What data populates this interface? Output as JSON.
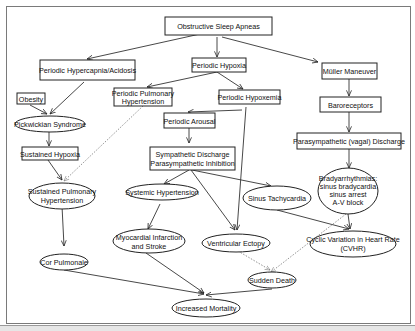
{
  "diagram": {
    "title": "Obstructive Sleep Apneas",
    "nodes": {
      "osa": "Obstructive Sleep Apneas",
      "hypercapnia": "Periodic Hypercapnia/Acidosis",
      "hypoxia": "Periodic Hypoxia",
      "muller": "Müller Maneuver",
      "obesity": "Obesity",
      "ppulm_l1": "Periodic Pulmonary",
      "ppulm_l2": "Hypertension",
      "hypoxemia": "Periodic Hypoxemia",
      "baroreceptors": "Baroreceptors",
      "pickwickian": "Pickwickian Syndrome",
      "arousal": "Periodic Arousal",
      "vagal": "Parasympathetic (vagal) Discharge",
      "sustained_hypoxia": "Sustained Hypoxia",
      "symp_l1": "Sympathetic Discharge",
      "symp_l2": "Parasympathetic Inhibition",
      "brady_l1": "Bradyarrhythmias:",
      "brady_l2": "sinus bradycardia",
      "brady_l3": "sinus arrest",
      "brady_l4": "A-V block",
      "spulm_l1": "Sustained Pulmonary",
      "spulm_l2": "Hypertension",
      "systemic_htn": "Systemic Hypertension",
      "sinus_tachy": "Sinus Tachycardia",
      "mi_l1": "Myocardial Infarction",
      "mi_l2": "and Stroke",
      "vent_ectopy": "Ventricular Ectopy",
      "cvhr_l1": "Cyclic Variation in Heart Rate",
      "cvhr_l2": "(CVHR)",
      "cor_pulmonale": "Cor Pulmonale",
      "sudden_death": "Sudden Death",
      "increased_mortality": "Increased Mortality"
    },
    "edges": [
      {
        "from": "Obstructive Sleep Apneas",
        "to": "Periodic Hypercapnia/Acidosis",
        "style": "solid"
      },
      {
        "from": "Obstructive Sleep Apneas",
        "to": "Periodic Hypoxia",
        "style": "solid"
      },
      {
        "from": "Obstructive Sleep Apneas",
        "to": "Müller Maneuver",
        "style": "solid"
      },
      {
        "from": "Periodic Hypoxia",
        "to": "Periodic Pulmonary Hypertension",
        "style": "solid"
      },
      {
        "from": "Periodic Hypoxia",
        "to": "Periodic Hypoxemia",
        "style": "solid"
      },
      {
        "from": "Periodic Hypercapnia/Acidosis",
        "to": "Pickwickian Syndrome",
        "style": "solid"
      },
      {
        "from": "Obesity",
        "to": "Pickwickian Syndrome",
        "style": "solid"
      },
      {
        "from": "Müller Maneuver",
        "to": "Baroreceptors",
        "style": "solid"
      },
      {
        "from": "Baroreceptors",
        "to": "Parasympathetic (vagal) Discharge",
        "style": "solid"
      },
      {
        "from": "Parasympathetic (vagal) Discharge",
        "to": "Bradyarrhythmias",
        "style": "solid"
      },
      {
        "from": "Periodic Hypoxemia",
        "to": "Periodic Arousal",
        "style": "solid"
      },
      {
        "from": "Periodic Hypoxemia",
        "to": "Ventricular Ectopy",
        "style": "solid"
      },
      {
        "from": "Periodic Arousal",
        "to": "Sympathetic Discharge Parasympathetic Inhibition",
        "style": "solid"
      },
      {
        "from": "Pickwickian Syndrome",
        "to": "Sustained Hypoxia",
        "style": "solid"
      },
      {
        "from": "Sustained Hypoxia",
        "to": "Sustained Pulmonary Hypertension",
        "style": "solid"
      },
      {
        "from": "Periodic Pulmonary Hypertension",
        "to": "Sustained Pulmonary Hypertension",
        "style": "dotted"
      },
      {
        "from": "Sympathetic Discharge Parasympathetic Inhibition",
        "to": "Systemic Hypertension",
        "style": "solid"
      },
      {
        "from": "Sympathetic Discharge Parasympathetic Inhibition",
        "to": "Sinus Tachycardia",
        "style": "solid"
      },
      {
        "from": "Sympathetic Discharge Parasympathetic Inhibition",
        "to": "Ventricular Ectopy",
        "style": "solid"
      },
      {
        "from": "Systemic Hypertension",
        "to": "Myocardial Infarction and Stroke",
        "style": "solid"
      },
      {
        "from": "Sinus Tachycardia",
        "to": "Cyclic Variation in Heart Rate (CVHR)",
        "style": "solid"
      },
      {
        "from": "Bradyarrhythmias",
        "to": "Cyclic Variation in Heart Rate (CVHR)",
        "style": "solid"
      },
      {
        "from": "Bradyarrhythmias",
        "to": "Sudden Death",
        "style": "dotted"
      },
      {
        "from": "Ventricular Ectopy",
        "to": "Sudden Death",
        "style": "dotted"
      },
      {
        "from": "Sustained Pulmonary Hypertension",
        "to": "Cor Pulmonale",
        "style": "solid"
      },
      {
        "from": "Cor Pulmonale",
        "to": "Increased Mortality",
        "style": "solid"
      },
      {
        "from": "Myocardial Infarction and Stroke",
        "to": "Increased Mortality",
        "style": "solid"
      },
      {
        "from": "Sudden Death",
        "to": "Increased Mortality",
        "style": "solid"
      }
    ]
  }
}
